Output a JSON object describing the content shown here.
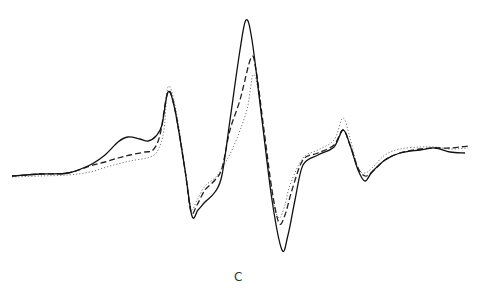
{
  "figure": {
    "panel_label": "C"
  },
  "chart_data": {
    "type": "line",
    "title": "",
    "panel_label": "C",
    "xlabel": "",
    "ylabel": "",
    "axes_visible": false,
    "grid": false,
    "legend": "none",
    "units": "pixel coordinates (x right, y down) in a 480x291 frame; no axes shown",
    "series": [
      {
        "name": "solid",
        "style": "solid",
        "color": "#111111",
        "points": [
          [
            12,
            176
          ],
          [
            40,
            174
          ],
          [
            68,
            173
          ],
          [
            90,
            165
          ],
          [
            105,
            155
          ],
          [
            118,
            142
          ],
          [
            128,
            137
          ],
          [
            140,
            139
          ],
          [
            148,
            141
          ],
          [
            156,
            136
          ],
          [
            162,
            125
          ],
          [
            168,
            92
          ],
          [
            175,
            110
          ],
          [
            185,
            170
          ],
          [
            192,
            216
          ],
          [
            198,
            210
          ],
          [
            205,
            202
          ],
          [
            215,
            192
          ],
          [
            222,
            175
          ],
          [
            230,
            120
          ],
          [
            240,
            50
          ],
          [
            246,
            20
          ],
          [
            252,
            40
          ],
          [
            262,
            120
          ],
          [
            272,
            200
          ],
          [
            282,
            250
          ],
          [
            288,
            235
          ],
          [
            295,
            200
          ],
          [
            303,
            165
          ],
          [
            318,
            155
          ],
          [
            334,
            147
          ],
          [
            343,
            130
          ],
          [
            350,
            145
          ],
          [
            358,
            170
          ],
          [
            365,
            181
          ],
          [
            372,
            172
          ],
          [
            385,
            160
          ],
          [
            400,
            153
          ],
          [
            420,
            150
          ],
          [
            435,
            148
          ],
          [
            450,
            152
          ],
          [
            465,
            153
          ]
        ]
      },
      {
        "name": "dashed",
        "style": "dashed",
        "color": "#222222",
        "points": [
          [
            12,
            176
          ],
          [
            40,
            174
          ],
          [
            68,
            173
          ],
          [
            90,
            166
          ],
          [
            105,
            162
          ],
          [
            118,
            158
          ],
          [
            130,
            155
          ],
          [
            145,
            152
          ],
          [
            153,
            150
          ],
          [
            160,
            135
          ],
          [
            168,
            92
          ],
          [
            175,
            110
          ],
          [
            185,
            170
          ],
          [
            191,
            212
          ],
          [
            197,
            205
          ],
          [
            205,
            190
          ],
          [
            215,
            180
          ],
          [
            222,
            168
          ],
          [
            230,
            130
          ],
          [
            240,
            100
          ],
          [
            251,
            58
          ],
          [
            256,
            70
          ],
          [
            264,
            130
          ],
          [
            272,
            190
          ],
          [
            279,
            223
          ],
          [
            285,
            215
          ],
          [
            292,
            190
          ],
          [
            303,
            160
          ],
          [
            318,
            153
          ],
          [
            334,
            145
          ],
          [
            343,
            130
          ],
          [
            350,
            145
          ],
          [
            358,
            168
          ],
          [
            365,
            176
          ],
          [
            372,
            172
          ],
          [
            385,
            160
          ],
          [
            400,
            153
          ],
          [
            420,
            149
          ],
          [
            435,
            148
          ],
          [
            450,
            148
          ],
          [
            468,
            146
          ]
        ]
      },
      {
        "name": "dotted",
        "style": "dotted",
        "color": "#666666",
        "points": [
          [
            12,
            177
          ],
          [
            40,
            176
          ],
          [
            68,
            175
          ],
          [
            90,
            172
          ],
          [
            110,
            166
          ],
          [
            130,
            161
          ],
          [
            150,
            157
          ],
          [
            158,
            150
          ],
          [
            164,
            130
          ],
          [
            168,
            87
          ],
          [
            175,
            105
          ],
          [
            185,
            168
          ],
          [
            191,
            208
          ],
          [
            197,
            200
          ],
          [
            205,
            186
          ],
          [
            215,
            178
          ],
          [
            222,
            168
          ],
          [
            232,
            150
          ],
          [
            242,
            125
          ],
          [
            248,
            105
          ],
          [
            253,
            75
          ],
          [
            258,
            90
          ],
          [
            266,
            150
          ],
          [
            273,
            200
          ],
          [
            279,
            218
          ],
          [
            285,
            205
          ],
          [
            290,
            185
          ],
          [
            303,
            158
          ],
          [
            318,
            150
          ],
          [
            334,
            140
          ],
          [
            343,
            118
          ],
          [
            350,
            138
          ],
          [
            358,
            168
          ],
          [
            365,
            173
          ],
          [
            372,
            168
          ],
          [
            385,
            155
          ],
          [
            400,
            149
          ],
          [
            420,
            147
          ],
          [
            435,
            147
          ],
          [
            450,
            149
          ],
          [
            468,
            148
          ]
        ]
      }
    ]
  }
}
